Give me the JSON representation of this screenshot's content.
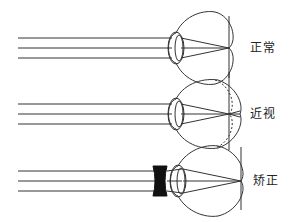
{
  "diagram": {
    "panels": [
      {
        "id": "normal",
        "label": "正常"
      },
      {
        "id": "myopia",
        "label": "近视"
      },
      {
        "id": "corrected",
        "label": "矫正"
      }
    ],
    "colors": {
      "stroke": "#333333",
      "lens_fill": "#111111",
      "background": "#ffffff"
    }
  }
}
